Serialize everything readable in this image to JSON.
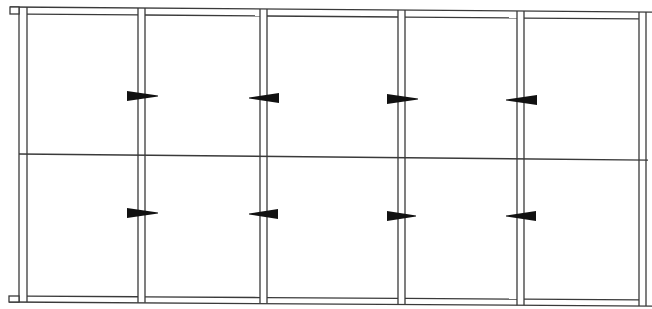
{
  "diagram": {
    "type": "frame-elevation",
    "stroke_color": "#3a3a3a",
    "wedge_color": "#111111",
    "background": "#ffffff",
    "posts": [
      {
        "x1": 19,
        "x2": 27
      },
      {
        "x1": 138,
        "x2": 145
      },
      {
        "x1": 260,
        "x2": 267
      },
      {
        "x1": 398,
        "x2": 405
      },
      {
        "x1": 517,
        "x2": 524
      },
      {
        "x1": 639,
        "x2": 646
      }
    ],
    "top_rail": {
      "y_left_outer": 7,
      "y_left_inner": 14,
      "y_right_outer": 12,
      "y_right_inner": 19
    },
    "bottom_rail": {
      "y_left_inner": 296,
      "y_left_outer": 302,
      "y_right_inner": 300,
      "y_right_outer": 306
    },
    "mid_line": {
      "y_left": 154,
      "y_right": 160
    },
    "wedges": [
      {
        "row": "upper",
        "x_broad": 127,
        "x_tip": 158,
        "y": 96,
        "direction": "right"
      },
      {
        "row": "upper",
        "x_broad": 279,
        "x_tip": 249,
        "y": 98,
        "direction": "left"
      },
      {
        "row": "upper",
        "x_broad": 387,
        "x_tip": 418,
        "y": 99,
        "direction": "right"
      },
      {
        "row": "upper",
        "x_broad": 537,
        "x_tip": 506,
        "y": 100,
        "direction": "left"
      },
      {
        "row": "lower",
        "x_broad": 127,
        "x_tip": 158,
        "y": 213,
        "direction": "right"
      },
      {
        "row": "lower",
        "x_broad": 278,
        "x_tip": 249,
        "y": 214,
        "direction": "left"
      },
      {
        "row": "lower",
        "x_broad": 387,
        "x_tip": 416,
        "y": 216,
        "direction": "right"
      },
      {
        "row": "lower",
        "x_broad": 536,
        "x_tip": 506,
        "y": 216,
        "direction": "left"
      }
    ],
    "end_caps": [
      {
        "x": 10,
        "y": 7,
        "w": 9,
        "h": 7,
        "position": "top-left"
      },
      {
        "x": 9,
        "y": 296,
        "w": 10,
        "h": 6,
        "position": "bottom-left"
      }
    ]
  }
}
